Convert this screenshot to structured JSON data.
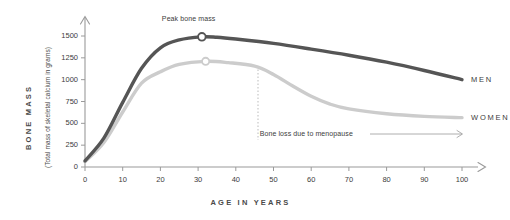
{
  "chart_data": {
    "type": "line",
    "title": "",
    "xlabel": "AGE IN YEARS",
    "ylabel": "BONE MASS",
    "ylabel_sub": "(Total mass of skeletal calcium in grams)",
    "xlim": [
      0,
      105
    ],
    "ylim": [
      0,
      1600
    ],
    "grid": false,
    "legend_position": "right-of-line-ends",
    "xticks": [
      "0",
      "10",
      "20",
      "30",
      "40",
      "50",
      "60",
      "70",
      "80",
      "90",
      "100"
    ],
    "xtick_values": [
      0,
      10,
      20,
      30,
      40,
      50,
      60,
      70,
      80,
      90,
      100
    ],
    "yticks": [
      "0",
      "250",
      "500",
      "750",
      "1000",
      "1250",
      "1500"
    ],
    "ytick_values": [
      0,
      250,
      500,
      750,
      1000,
      1250,
      1500
    ],
    "series": [
      {
        "name": "MEN",
        "color": "#555555",
        "x": [
          0,
          5,
          10,
          15,
          20,
          25,
          31,
          35,
          40,
          50,
          60,
          70,
          80,
          90,
          100
        ],
        "values": [
          70,
          330,
          740,
          1130,
          1365,
          1455,
          1490,
          1485,
          1465,
          1415,
          1350,
          1280,
          1200,
          1105,
          1000
        ],
        "peak_marker": {
          "x": 31,
          "y": 1490,
          "label": "Peak bone mass"
        }
      },
      {
        "name": "WOMEN",
        "color": "#cccccc",
        "x": [
          0,
          5,
          10,
          15,
          20,
          25,
          32,
          38,
          45,
          50,
          55,
          60,
          65,
          70,
          80,
          90,
          100
        ],
        "values": [
          60,
          280,
          630,
          960,
          1090,
          1175,
          1210,
          1195,
          1155,
          1060,
          930,
          810,
          720,
          665,
          610,
          580,
          565
        ],
        "peak_marker": {
          "x": 32,
          "y": 1210,
          "label": ""
        }
      }
    ],
    "annotations": [
      {
        "name": "peak-bone-mass",
        "text": "Peak bone mass",
        "x": 31,
        "y": 1490
      },
      {
        "name": "bone-loss-menopause",
        "text": "Bone loss due to menopause",
        "marker_x": 45,
        "marker_y_top": 1160,
        "marker_y_bottom": 420,
        "arrow_to_x": 103
      }
    ]
  },
  "colors": {
    "men": "#555555",
    "women": "#cccccc",
    "axis": "#9a9a9a",
    "text": "#3c3c3c",
    "dotted": "#bbbbbb"
  }
}
